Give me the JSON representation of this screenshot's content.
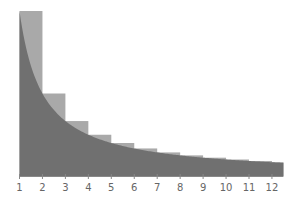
{
  "chart_data": {
    "type": "bar",
    "title": "",
    "xlabel": "",
    "ylabel": "",
    "categories": [
      "1",
      "2",
      "3",
      "4",
      "5",
      "6",
      "7",
      "8",
      "9",
      "10",
      "11",
      "12"
    ],
    "series": [
      {
        "name": "bars 1/n",
        "kind": "bar",
        "x_start": [
          1,
          2,
          3,
          4,
          5,
          6,
          7,
          8,
          9,
          10,
          11,
          12
        ],
        "x_end": [
          2,
          3,
          4,
          5,
          6,
          7,
          8,
          9,
          10,
          11,
          12,
          12.5
        ],
        "values": [
          1.0,
          0.5,
          0.333,
          0.25,
          0.2,
          0.167,
          0.143,
          0.125,
          0.111,
          0.1,
          0.091,
          0.083
        ],
        "color": "#a9a9a9"
      },
      {
        "name": "curve 1/x",
        "kind": "area",
        "function": "1/x",
        "x_range": [
          1,
          12.5
        ],
        "color": "#707070"
      }
    ],
    "xticks": [
      1,
      2,
      3,
      4,
      5,
      6,
      7,
      8,
      9,
      10,
      11,
      12
    ],
    "xlim": [
      1,
      12.5
    ],
    "ylim": [
      0,
      1
    ],
    "grid": false,
    "legend": null
  },
  "axis": {
    "tick_labels": [
      "1",
      "2",
      "3",
      "4",
      "5",
      "6",
      "7",
      "8",
      "9",
      "10",
      "11",
      "12"
    ]
  },
  "colors": {
    "bar": "#a9a9a9",
    "area": "#707070",
    "axis": "#888888",
    "label": "#666666"
  }
}
